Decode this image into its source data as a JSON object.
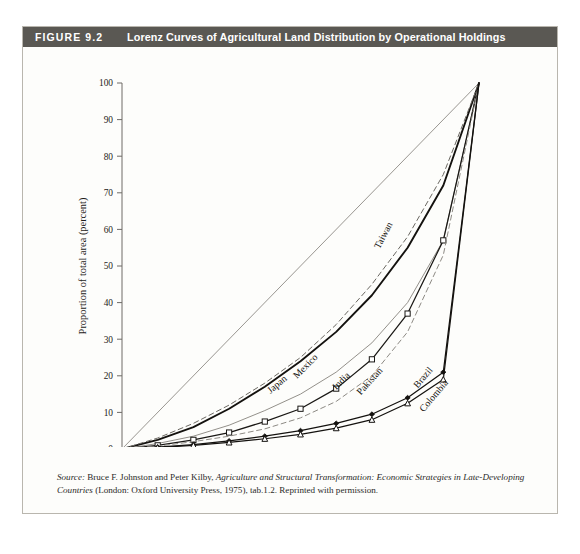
{
  "figure": {
    "number": "FIGURE 9.2",
    "title": "Lorenz Curves of Agricultural Land Distribution by Operational Holdings",
    "header_bg": "#5a5853",
    "header_text_color": "#ffffff",
    "card_bg": "#fdfdfb",
    "border_color": "#b9b6ae"
  },
  "source": {
    "label": "Source:",
    "text_part1": " Bruce F. Johnston and Peter Kilby, ",
    "work_title": "Agriculture and Structural Transformation: Economic Strategies in Late-Developing Countries",
    "text_part2": " (London: Oxford University Press, 1975), tab.1.2. Reprinted with permission."
  },
  "chart_data": {
    "type": "line",
    "title": "Lorenz Curves of Agricultural Land Distribution by Operational Holdings",
    "xlabel": "Proportion of total holdings (percent)",
    "ylabel": "Proportion of total area (percent)",
    "xlim": [
      0,
      100
    ],
    "ylim": [
      0,
      100
    ],
    "xticks": [
      0,
      10,
      20,
      30,
      40,
      50,
      60,
      70,
      80,
      90,
      100
    ],
    "yticks": [
      0,
      10,
      20,
      30,
      40,
      50,
      60,
      70,
      80,
      90,
      100
    ],
    "grid": false,
    "legend": "inline-curve-labels",
    "x": [
      0,
      10,
      20,
      30,
      40,
      50,
      60,
      70,
      80,
      90,
      100
    ],
    "reference_line": {
      "name": "line-of-equality",
      "points": [
        [
          0,
          0
        ],
        [
          100,
          100
        ]
      ],
      "style": "thin-solid-gray",
      "color": "#8d8a84"
    },
    "series": [
      {
        "name": "Japan",
        "style": "solid-heavy",
        "color": "#14120f",
        "marker": "none",
        "label_x": 44,
        "label_y": 17,
        "label_angle": -40,
        "values": [
          0,
          2.5,
          6,
          11,
          17,
          24,
          32,
          42,
          55,
          72,
          100
        ]
      },
      {
        "name": "Taiwan",
        "style": "dashed",
        "color": "#6b6862",
        "marker": "none",
        "label_x": 74,
        "label_y": 58,
        "label_angle": -62,
        "values": [
          0,
          3,
          7,
          12,
          18,
          25,
          34,
          45,
          58,
          75,
          100
        ]
      },
      {
        "name": "Mexico",
        "style": "thin-solid-gray",
        "color": "#8d8a84",
        "marker": "none",
        "label_x": 52,
        "label_y": 22,
        "label_angle": -45,
        "values": [
          0,
          1.5,
          3.5,
          6.5,
          10.5,
          15,
          21,
          29,
          40,
          57,
          100
        ]
      },
      {
        "name": "India",
        "style": "solid-open-square",
        "color": "#1a1815",
        "marker": "open-square",
        "label_x": 62,
        "label_y": 18,
        "label_angle": -45,
        "values": [
          0,
          1,
          2.5,
          4.5,
          7.5,
          11,
          16.5,
          24.5,
          37,
          57,
          100
        ]
      },
      {
        "name": "Pakistan",
        "style": "dashed",
        "color": "#8d8a84",
        "marker": "none",
        "label_x": 70,
        "label_y": 18,
        "label_angle": -48,
        "values": [
          0,
          0.8,
          2,
          3.5,
          5.5,
          8.5,
          13,
          20,
          32,
          53,
          100
        ]
      },
      {
        "name": "Brazil",
        "style": "solid-filled-diamond",
        "color": "#14120f",
        "marker": "filled-diamond",
        "label_x": 85,
        "label_y": 19,
        "label_angle": -50,
        "values": [
          0,
          0.5,
          1.2,
          2.2,
          3.5,
          5,
          7,
          9.5,
          14,
          21,
          100
        ]
      },
      {
        "name": "Colombia",
        "style": "solid-open-triangle",
        "color": "#14120f",
        "marker": "open-triangle",
        "label_x": 88,
        "label_y": 14,
        "label_angle": -50,
        "values": [
          0,
          0.4,
          1,
          1.8,
          2.8,
          4,
          5.7,
          8,
          12.5,
          19,
          100
        ]
      }
    ]
  }
}
